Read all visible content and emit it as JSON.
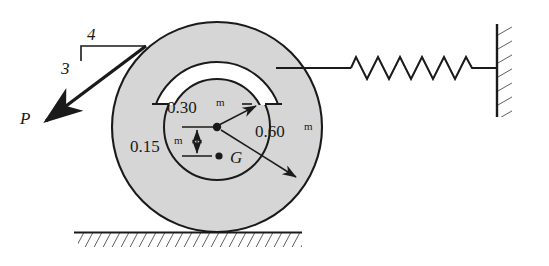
{
  "figure": {
    "name": "wheel-spring-mechanics-diagram",
    "background_color": "#ffffff",
    "wheel_fill": "#d6d6d6",
    "groove_fill": "#ffffff",
    "line_color": "#1a1a1a"
  },
  "dimensions": {
    "inner_radius": {
      "value": "0.30",
      "unit": "m",
      "label": "0.30"
    },
    "outer_radius": {
      "value": "0.60",
      "unit": "m",
      "label": "0.60"
    },
    "center_to_g": {
      "value": "0.15",
      "unit": "m",
      "label": "0.15"
    }
  },
  "points": {
    "center_label": "",
    "gravity_label": "G"
  },
  "force": {
    "label": "P",
    "slope_run": "4",
    "slope_rise": "3"
  },
  "spring": {
    "coils": 8,
    "label": ""
  },
  "ground": {
    "label": ""
  },
  "wall": {
    "label": ""
  }
}
